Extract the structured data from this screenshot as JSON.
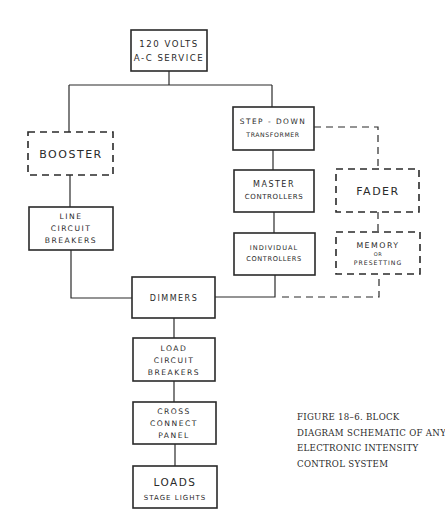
{
  "diagram": {
    "nodes": [
      {
        "id": "service",
        "lines": [
          "120 VOLTS",
          "A-C SERVICE"
        ],
        "style": "solid"
      },
      {
        "id": "booster",
        "lines": [
          "BOOSTER"
        ],
        "style": "dashed"
      },
      {
        "id": "step_down",
        "lines": [
          "STEP - DOWN",
          "TRANSFORMER"
        ],
        "style": "solid"
      },
      {
        "id": "master",
        "lines": [
          "MASTER",
          "CONTROLLERS"
        ],
        "style": "solid"
      },
      {
        "id": "fader",
        "lines": [
          "FADER"
        ],
        "style": "dashed"
      },
      {
        "id": "line_cb",
        "lines": [
          "LINE",
          "CIRCUIT",
          "BREAKERS"
        ],
        "style": "solid"
      },
      {
        "id": "individual",
        "lines": [
          "INDIVIDUAL",
          "CONTROLLERS"
        ],
        "style": "solid"
      },
      {
        "id": "memory",
        "lines": [
          "MEMORY",
          "OR",
          "PRESETTING"
        ],
        "style": "dashed"
      },
      {
        "id": "dimmers",
        "lines": [
          "DIMMERS"
        ],
        "style": "solid"
      },
      {
        "id": "load_cb",
        "lines": [
          "LOAD",
          "CIRCUIT",
          "BREAKERS"
        ],
        "style": "solid"
      },
      {
        "id": "cross",
        "lines": [
          "CROSS",
          "CONNECT",
          "PANEL"
        ],
        "style": "solid"
      },
      {
        "id": "loads",
        "lines": [
          "LOADS",
          "STAGE LIGHTS"
        ],
        "style": "solid"
      }
    ],
    "edges": [
      {
        "from": "service",
        "to": "booster",
        "style": "solid"
      },
      {
        "from": "service",
        "to": "step_down",
        "style": "solid"
      },
      {
        "from": "booster",
        "to": "line_cb",
        "style": "solid"
      },
      {
        "from": "line_cb",
        "to": "dimmers",
        "style": "solid"
      },
      {
        "from": "step_down",
        "to": "master",
        "style": "solid"
      },
      {
        "from": "step_down",
        "to": "fader",
        "style": "dashed"
      },
      {
        "from": "master",
        "to": "individual",
        "style": "solid"
      },
      {
        "from": "fader",
        "to": "memory",
        "style": "dashed"
      },
      {
        "from": "individual",
        "to": "dimmers",
        "style": "solid"
      },
      {
        "from": "memory",
        "to": "dimmers",
        "style": "dashed"
      },
      {
        "from": "dimmers",
        "to": "load_cb",
        "style": "solid"
      },
      {
        "from": "load_cb",
        "to": "cross",
        "style": "solid"
      },
      {
        "from": "cross",
        "to": "loads",
        "style": "solid"
      }
    ]
  },
  "labels": {
    "service_1": "120 VOLTS",
    "service_2": "A-C SERVICE",
    "booster": "BOOSTER",
    "step_down_1": "STEP - DOWN",
    "step_down_2": "TRANSFORMER",
    "master_1": "MASTER",
    "master_2": "CONTROLLERS",
    "fader": "FADER",
    "line_cb_1": "LINE",
    "line_cb_2": "CIRCUIT",
    "line_cb_3": "BREAKERS",
    "individual_1": "INDIVIDUAL",
    "individual_2": "CONTROLLERS",
    "memory_1": "MEMORY",
    "memory_2": "OR",
    "memory_3": "PRESETTING",
    "dimmers": "DIMMERS",
    "load_cb_1": "LOAD",
    "load_cb_2": "CIRCUIT",
    "load_cb_3": "BREAKERS",
    "cross_1": "CROSS",
    "cross_2": "CONNECT",
    "cross_3": "PANEL",
    "loads_1": "LOADS",
    "loads_2": "STAGE LIGHTS"
  },
  "caption": {
    "lines": [
      "FIGURE 18–6.   BLOCK",
      "DIAGRAM SCHEMATIC OF ANY",
      "ELECTRONIC INTENSITY",
      "CONTROL SYSTEM"
    ]
  }
}
